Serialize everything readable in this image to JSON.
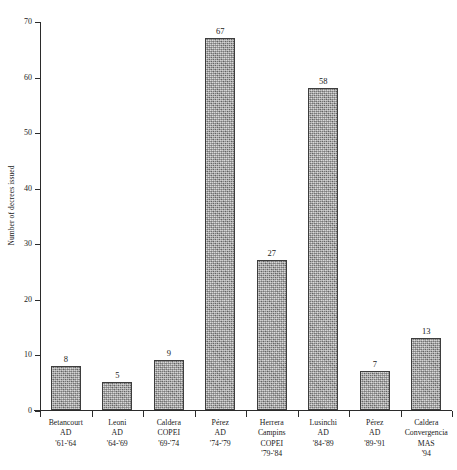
{
  "chart_data": {
    "type": "bar",
    "title": "",
    "xlabel": "",
    "ylabel": "Number of decrees issued",
    "ylim": [
      0,
      70
    ],
    "ytick_labels": [
      "0",
      "10",
      "20",
      "30",
      "40",
      "50",
      "60",
      "70"
    ],
    "ytick_values": [
      0,
      10,
      20,
      30,
      40,
      50,
      60,
      70
    ],
    "grid": false,
    "legend": "none",
    "categories": [
      "Betancourt AD '61-'64",
      "Leoni AD '64-'69",
      "Caldera COPEI '69-'74",
      "Pérez AD '74-'79",
      "Herrera Campins COPEI '79-'84",
      "Lusinchi AD '84-'89",
      "Pérez AD '89-'91",
      "Caldera Convergencia MAS '94"
    ],
    "category_lines": [
      [
        "Betancourt",
        "AD",
        "'61-'64"
      ],
      [
        "Leoni",
        "AD",
        "'64-'69"
      ],
      [
        "Caldera",
        "COPEI",
        "'69-'74"
      ],
      [
        "Pérez",
        "AD",
        "'74-'79"
      ],
      [
        "Herrera",
        "Campins",
        "COPEI",
        "'79-'84"
      ],
      [
        "Lusinchi",
        "AD",
        "'84-'89"
      ],
      [
        "Pérez",
        "AD",
        "'89-'91"
      ],
      [
        "Caldera",
        "Convergencia",
        "MAS",
        "'94"
      ]
    ],
    "values": [
      8,
      5,
      9,
      67,
      27,
      58,
      7,
      13
    ],
    "value_labels": [
      "8",
      "5",
      "9",
      "67",
      "27",
      "58",
      "7",
      "13"
    ],
    "bar_color": "#a3a3a3",
    "bar_border_color": "#3d3d3d",
    "axis_color": "#2b2b2b"
  }
}
